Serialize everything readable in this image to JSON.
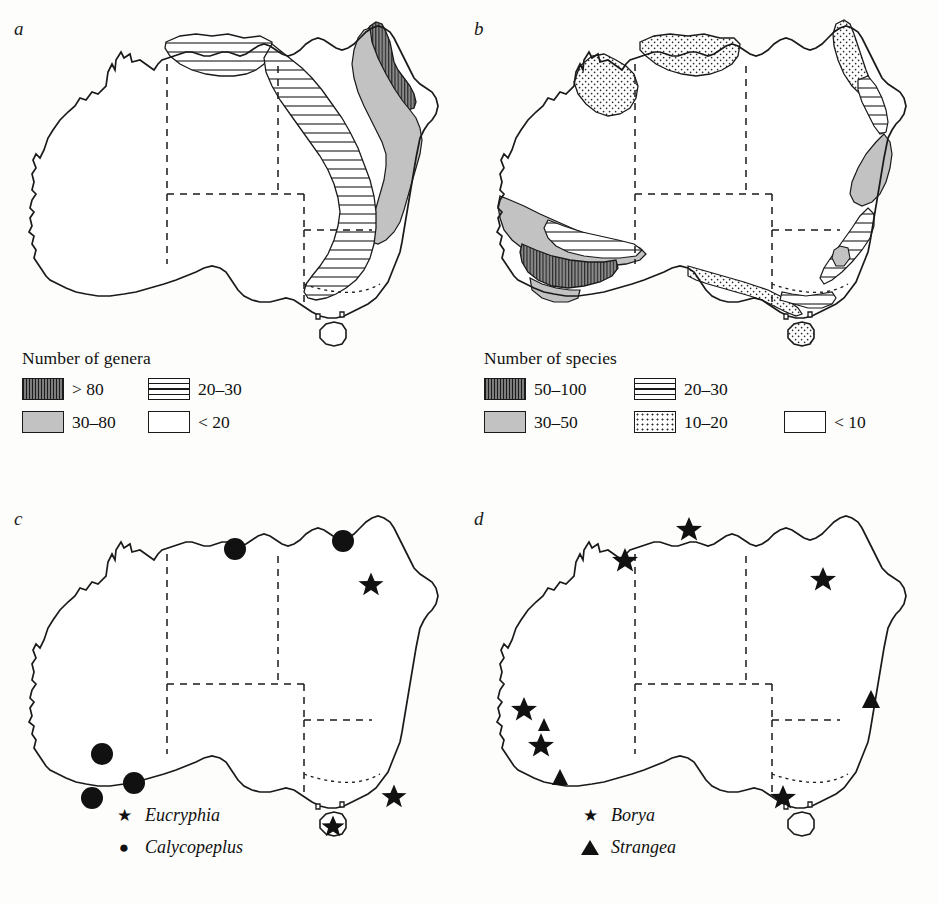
{
  "figure": {
    "type": "map"
  },
  "panels": [
    {
      "id": "a",
      "label": "a",
      "legend": {
        "title": "Number of genera",
        "entries": [
          {
            "label": "> 80",
            "pattern": "dark-vertical-hatch"
          },
          {
            "label": "20–30",
            "pattern": "horizontal-lines"
          },
          {
            "label": "30–80",
            "pattern": "mid-grey"
          },
          {
            "label": "< 20",
            "pattern": "plain-white"
          }
        ]
      }
    },
    {
      "id": "b",
      "label": "b",
      "legend": {
        "title": "Number of species",
        "entries": [
          {
            "label": "50–100",
            "pattern": "dark-vertical-hatch"
          },
          {
            "label": "20–30",
            "pattern": "horizontal-lines"
          },
          {
            "label": "30–50",
            "pattern": "mid-grey"
          },
          {
            "label": "10–20",
            "pattern": "dots"
          },
          {
            "label": "< 10",
            "pattern": "plain-white"
          }
        ]
      }
    },
    {
      "id": "c",
      "label": "c",
      "legend": {
        "entries": [
          {
            "label": "Eucryphia",
            "marker": "star"
          },
          {
            "label": "Calycopeplus",
            "marker": "circle"
          }
        ]
      }
    },
    {
      "id": "d",
      "label": "d",
      "legend": {
        "entries": [
          {
            "label": "Borya",
            "marker": "star"
          },
          {
            "label": "Strangea",
            "marker": "triangle"
          }
        ]
      }
    }
  ],
  "markers": {
    "panel_c": {
      "star": [
        [
          381,
          567
        ],
        [
          404,
          779
        ],
        [
          377,
          844
        ]
      ],
      "circle": [
        [
          246,
          541
        ],
        [
          355,
          533
        ],
        [
          110,
          740
        ],
        [
          143,
          770
        ],
        [
          101,
          786
        ]
      ]
    },
    "panel_d": {
      "star": [
        [
          719,
          513
        ],
        [
          653,
          560
        ],
        [
          845,
          579
        ],
        [
          548,
          713
        ],
        [
          569,
          743
        ],
        [
          818,
          797
        ]
      ],
      "triangle": [
        [
          565,
          728
        ],
        [
          578,
          779
        ],
        [
          887,
          692
        ]
      ]
    }
  },
  "colors": {
    "ink": "#1a1a1a",
    "dark_grey": "#7d7d7d",
    "mid_grey": "#c2c2c2",
    "light_grey": "#d9d9d9",
    "paper": "#fdfdfb"
  }
}
